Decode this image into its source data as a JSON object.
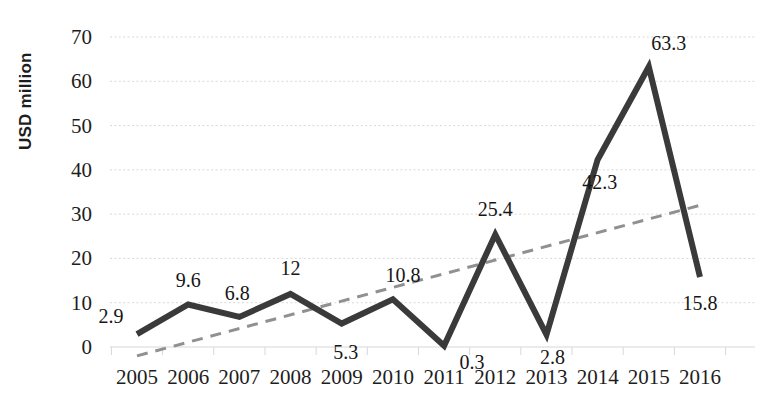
{
  "chart_data": {
    "type": "line",
    "title": "",
    "xlabel": "",
    "ylabel": "USD million",
    "categories": [
      "2005",
      "2006",
      "2007",
      "2008",
      "2009",
      "2010",
      "2011",
      "2012",
      "2013",
      "2014",
      "2015",
      "2016"
    ],
    "values": [
      2.9,
      9.6,
      6.8,
      12,
      5.3,
      10.8,
      0.3,
      25.4,
      2.8,
      42.3,
      63.3,
      15.8
    ],
    "point_labels": [
      "2.9",
      "9.6",
      "6.8",
      "12",
      "5.3",
      "10.8",
      "0.3",
      "25.4",
      "2.8",
      "42.3",
      "63.3",
      "15.8"
    ],
    "ylim": [
      0,
      70
    ],
    "ytick_values": [
      0,
      10,
      20,
      30,
      40,
      50,
      60,
      70
    ],
    "ytick_labels": [
      "0",
      "10",
      "20",
      "30",
      "40",
      "50",
      "60",
      "70"
    ],
    "grid": true,
    "grid_axis": "y",
    "legend": "none",
    "series": [
      {
        "name": "USD million",
        "style": "solid",
        "color": "#3a3a3a",
        "width": 6,
        "values": [
          2.9,
          9.6,
          6.8,
          12,
          5.3,
          10.8,
          0.3,
          25.4,
          2.8,
          42.3,
          63.3,
          15.8
        ]
      },
      {
        "name": "Linear trend",
        "style": "dashed",
        "color": "#909090",
        "width": 3,
        "endpoints": [
          -2.0,
          32.0
        ]
      }
    ],
    "colors": {
      "data_line": "#3a3a3a",
      "trend_line": "#909090",
      "gridline": "#d8d8d8",
      "text": "#1d1d1d",
      "background": "#ffffff"
    }
  }
}
